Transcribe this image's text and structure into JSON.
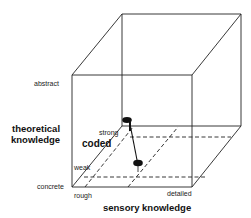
{
  "diagram": {
    "type": "3d-cube-concept-space",
    "axes": {
      "vertical": {
        "title": "theoretical knowledge",
        "title_line1": "theoretical",
        "title_line2": "knowledge",
        "high_label": "abstract",
        "low_label": "concrete"
      },
      "horizontal": {
        "title": "sensory knowledge",
        "low_label": "rough",
        "high_label": "detailed"
      },
      "depth": {
        "title": "coded",
        "high_label": "strong",
        "low_label": "weak"
      }
    },
    "nodes": [
      {
        "name": "upper-node",
        "cx": 127,
        "cy": 120
      },
      {
        "name": "lower-node",
        "cx": 138,
        "cy": 163
      }
    ],
    "colors": {
      "line": "#222222",
      "node": "#111111",
      "background": "#ffffff"
    }
  }
}
